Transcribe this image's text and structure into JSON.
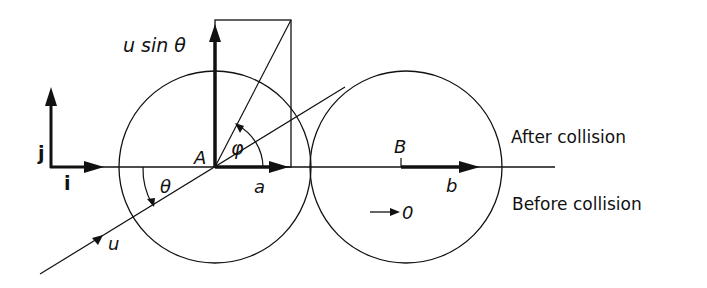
{
  "diagram": {
    "labels": {
      "u_sin_theta": "u sin θ",
      "point_A": "A",
      "point_B": "B",
      "angle_phi": "φ",
      "angle_theta": "θ",
      "vector_a": "a",
      "vector_b": "b",
      "vector_u": "u",
      "unit_i": "i",
      "unit_j": "j",
      "zero_velocity": "0",
      "after_collision": "After collision",
      "before_collision": "Before collision"
    },
    "colors": {
      "ink": "#111111",
      "background": "#ffffff"
    }
  }
}
